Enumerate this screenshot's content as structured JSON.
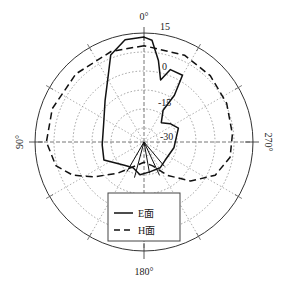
{
  "chart_data": {
    "type": "polar",
    "title": "",
    "angle_labels": [
      {
        "label": "0°",
        "angle": 0
      },
      {
        "label": "90°",
        "angle": 90
      },
      {
        "label": "180°",
        "angle": 180
      },
      {
        "label": "270°",
        "angle": 270
      }
    ],
    "angle_direction": "counter-clockwise, 0° at top, 90° at left",
    "radial_labels": [
      "15",
      "0",
      "-15",
      "-30"
    ],
    "radial_unit": "dB",
    "radial_range": [
      -28,
      15
    ],
    "ring_step_db": 7.5,
    "grid": true,
    "legend_position": "bottom-center",
    "legend": [
      "E面",
      "H面"
    ],
    "series": [
      {
        "name": "E面",
        "style": "solid",
        "points": [
          [
            0,
            13.4
          ],
          [
            10.5,
            13
          ],
          [
            21,
            8.7
          ],
          [
            28,
            2
          ],
          [
            43,
            -5.5
          ],
          [
            67,
            -10.7
          ],
          [
            94,
            -11.5
          ],
          [
            114,
            -10.7
          ],
          [
            140,
            -16
          ],
          [
            157,
            -17
          ],
          [
            173,
            -15
          ],
          [
            191,
            -16
          ],
          [
            212,
            -16
          ],
          [
            229,
            -17
          ],
          [
            259,
            -16
          ],
          [
            292,
            -13.4
          ],
          [
            305,
            -15.4
          ],
          [
            318,
            -17.8
          ],
          [
            329,
            -13.4
          ],
          [
            327,
            -6
          ],
          [
            330,
            2.4
          ],
          [
            340,
            2.4
          ],
          [
            345,
            -2.7
          ],
          [
            350,
            4.7
          ],
          [
            355.5,
            12.3
          ],
          [
            360,
            13.4
          ]
        ]
      },
      {
        "name": "H面",
        "style": "dashed",
        "points": [
          [
            0,
            10
          ],
          [
            20,
            10
          ],
          [
            45,
            10
          ],
          [
            70,
            10.5
          ],
          [
            90,
            10.5
          ],
          [
            105,
            8
          ],
          [
            115,
            3
          ],
          [
            125,
            -4
          ],
          [
            140,
            -12
          ],
          [
            160,
            -18
          ],
          [
            180,
            -20
          ],
          [
            200,
            -18
          ],
          [
            215,
            -12
          ],
          [
            230,
            -4
          ],
          [
            245,
            3
          ],
          [
            260,
            6.5
          ],
          [
            275,
            7
          ],
          [
            295,
            8
          ],
          [
            315,
            9
          ],
          [
            335,
            9.8
          ],
          [
            360,
            10
          ]
        ]
      }
    ]
  },
  "legend": {
    "e_label": "E面",
    "h_label": "H面"
  },
  "axes": {
    "top": "0°",
    "left": "90°",
    "right": "270°",
    "bottom": "180°",
    "r15": "15",
    "r0": "0",
    "rm15": "-15",
    "rm30": "-30"
  }
}
